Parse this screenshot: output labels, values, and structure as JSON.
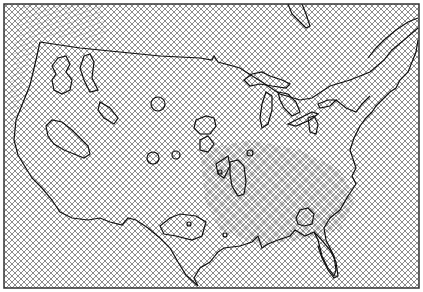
{
  "map": {
    "type": "mesh-hatched region map",
    "region": "Continental United States with southern Canada",
    "frame": {
      "x": 4,
      "y": 4,
      "width": 415,
      "height": 284
    },
    "colors": {
      "background": "#ffffff",
      "hatch": "#555555",
      "outline": "#111111",
      "frame": "#333333"
    },
    "features": [
      {
        "name": "coastline-and-borders"
      },
      {
        "name": "great-lakes"
      },
      {
        "name": "contour-regions"
      },
      {
        "name": "florida-peninsula"
      },
      {
        "name": "hudson-bay-edge"
      }
    ]
  }
}
